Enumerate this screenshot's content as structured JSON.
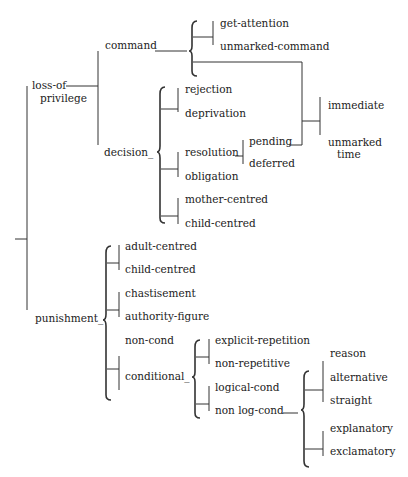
{
  "diagram": {
    "type": "system-network",
    "root": {
      "branches": [
        "loss-of-privilege",
        "punishment"
      ]
    },
    "labels": {
      "loss_of": "loss-of",
      "privilege": "privilege",
      "command": "command",
      "get_attention": "get-attention",
      "unmarked_command": "unmarked-command",
      "decision": "decision_",
      "rejection": "rejection",
      "deprivation": "deprivation",
      "resolution": "resolution",
      "pending": "pending",
      "deferred": "deferred",
      "obligation": "obligation",
      "mother_centred": "mother-centred",
      "child_centred_1": "child-centred",
      "immediate": "immediate",
      "unmarked": "unmarked",
      "time": "time",
      "punishment": "punishment_",
      "adult_centred": "adult-centred",
      "child_centred_2": "child-centred",
      "chastisement": "chastisement",
      "authority_figure": "authority-figure",
      "non_cond": "non-cond",
      "conditional": "conditional_",
      "explicit_repetition": "explicit-repetition",
      "non_repetitive": "non-repetitive",
      "logical_cond": "logical-cond",
      "non_log_cond": "non log-cond",
      "reason": "reason",
      "alternative": "alternative",
      "straight": "straight",
      "explanatory": "explanatory",
      "exclamatory": "exclamatory"
    },
    "tree": {
      "loss-of-privilege": {
        "command": {
          "simultaneous": [
            [
              "get-attention",
              "unmarked-command"
            ],
            [
              "immediate",
              "unmarked time"
            ]
          ]
        },
        "decision": {
          "simultaneous": [
            [
              "rejection",
              "deprivation"
            ],
            [
              "resolution",
              "obligation"
            ],
            [
              "mother-centred",
              "child-centred"
            ]
          ],
          "resolution": [
            "pending",
            "deferred"
          ],
          "pending": [
            "immediate",
            "unmarked time"
          ]
        }
      },
      "punishment": {
        "simultaneous": [
          [
            "adult-centred",
            "child-centred"
          ],
          [
            "chastisement",
            "authority-figure"
          ],
          [
            "non-cond",
            "conditional"
          ]
        ],
        "conditional": {
          "simultaneous": [
            [
              "explicit-repetition",
              "non-repetitive"
            ],
            [
              "logical-cond",
              "non log-cond"
            ]
          ],
          "non log-cond": {
            "simultaneous": [
              [
                "reason",
                "alternative",
                "straight"
              ],
              [
                "explanatory",
                "exclamatory"
              ]
            ]
          }
        }
      }
    }
  }
}
